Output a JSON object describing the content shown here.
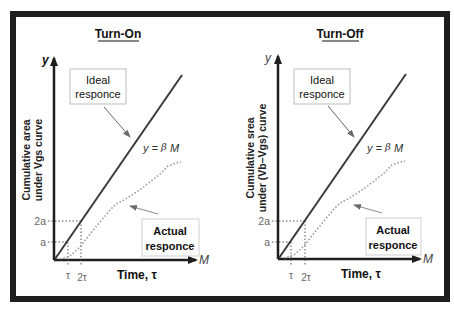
{
  "colors": {
    "frame": "#1e1e1e",
    "ideal_line": "#3a3a3a",
    "actual_line": "#9a9a9a",
    "guide_line": "#555555",
    "callout_border": "#bdbdbd",
    "callout_arrow": "#8a8a8a",
    "text": "#111111",
    "tick_text": "#666666"
  },
  "panels": [
    {
      "title": "Turn-On",
      "y_axis_symbol": "y",
      "x_axis_symbol": "M",
      "y_label_line1": "Cumulative area",
      "y_label_line2": "under Vgs curve",
      "x_label": "Time, τ",
      "equation_prefix": "y = ",
      "equation_beta": "β",
      "equation_suffix": " M",
      "ideal_label_line1": "Ideal",
      "ideal_label_line2": "responce",
      "actual_label_line1": "Actual",
      "actual_label_line2": "responce",
      "y_ticks": [
        "2a",
        "a"
      ],
      "x_ticks": [
        "τ",
        "2τ"
      ]
    },
    {
      "title": "Turn-Off",
      "y_axis_symbol": "y",
      "x_axis_symbol": "M",
      "y_label_line1": "Cumulative srea",
      "y_label_line2": "under (Vb–Vgs) curve",
      "x_label": "Time, τ",
      "equation_prefix": "y = ",
      "equation_beta": "β",
      "equation_suffix": " M",
      "ideal_label_line1": "Ideal",
      "ideal_label_line2": "responce",
      "actual_label_line1": "Actual",
      "actual_label_line2": "responce",
      "y_ticks": [
        "2a",
        "a"
      ],
      "x_ticks": [
        "τ",
        "2τ"
      ]
    }
  ]
}
